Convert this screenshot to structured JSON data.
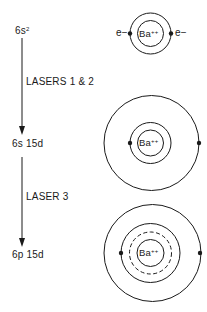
{
  "diagram": {
    "type": "energy-level excitation scheme",
    "levels": [
      {
        "id": "ground",
        "label": "6s",
        "superscript": "2"
      },
      {
        "id": "intermediate",
        "label": "6s 15d"
      },
      {
        "id": "final",
        "label": "6p 15d"
      }
    ],
    "transitions": [
      {
        "from": "ground",
        "to": "intermediate",
        "label": "LASERS 1 & 2"
      },
      {
        "from": "intermediate",
        "to": "final",
        "label": "LASER 3"
      }
    ],
    "atoms": [
      {
        "level": "ground",
        "core_label": "Ba",
        "core_charge": "++",
        "electron_left": "e−",
        "electron_right": "e−",
        "orbits": [
          "solid",
          "solid"
        ]
      },
      {
        "level": "intermediate",
        "core_label": "Ba",
        "core_charge": "++",
        "orbits": [
          "solid",
          "solid",
          "solid"
        ]
      },
      {
        "level": "final",
        "core_label": "Ba",
        "core_charge": "++",
        "orbits": [
          "solid",
          "dashed",
          "solid",
          "solid"
        ]
      }
    ],
    "colors": {
      "ink": "#1a1a1a",
      "background": "#ffffff"
    }
  }
}
